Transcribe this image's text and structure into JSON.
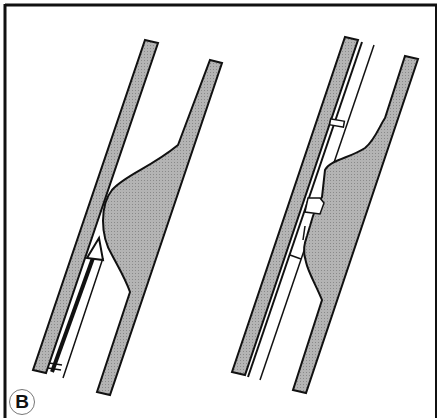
{
  "figure": {
    "panel_label": "B",
    "colors": {
      "frame": "#111111",
      "wall_fill": "#b0b0b0",
      "lesion_fill": "#a8a8a8",
      "stroke": "#111111",
      "background": "#ffffff"
    },
    "panels": [
      {
        "name": "left-panel",
        "description": "Vessel with eccentric lesion and catheter with arrowhead advancing alongside wall"
      },
      {
        "name": "right-panel",
        "description": "Vessel with eccentric lesion and device with notched segments along wall"
      }
    ]
  }
}
